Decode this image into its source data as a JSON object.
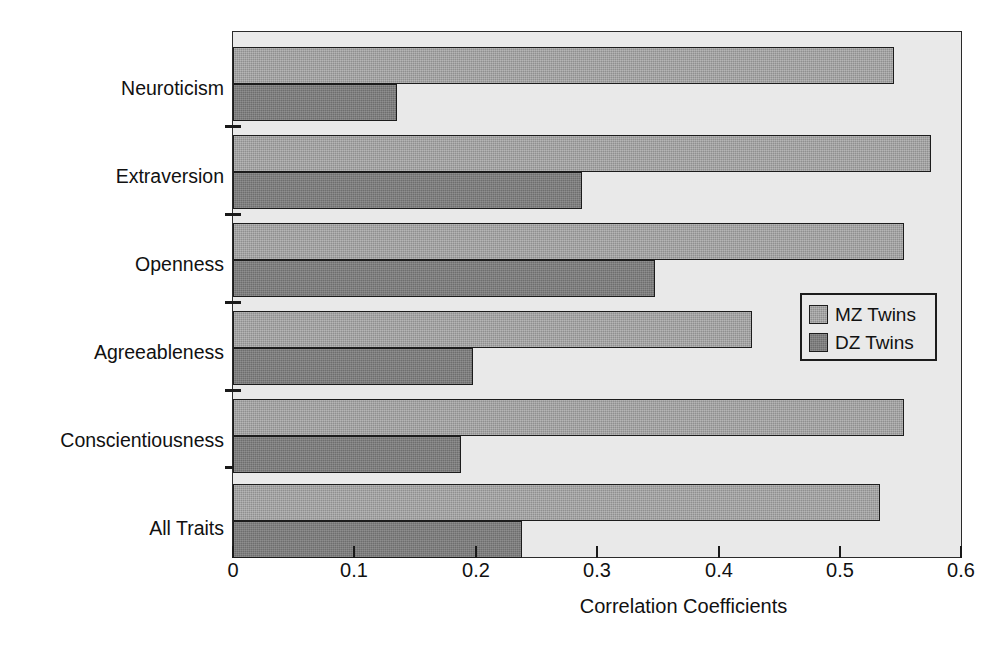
{
  "chart_data": {
    "type": "bar",
    "orientation": "horizontal",
    "title": "",
    "xlabel": "Correlation Coefficients",
    "ylabel": "",
    "xlim": [
      0,
      0.6
    ],
    "xticks": [
      "0",
      "0.1",
      "0.2",
      "0.3",
      "0.4",
      "0.5",
      "0.6"
    ],
    "xtick_values": [
      0,
      0.1,
      0.2,
      0.3,
      0.4,
      0.5,
      0.6
    ],
    "grid": false,
    "legend_position": "center-right",
    "categories": [
      "Neuroticism",
      "Extraversion",
      "Openness",
      "Agreeableness",
      "Conscientiousness",
      "All Traits"
    ],
    "series": [
      {
        "name": "MZ Twins",
        "color": "#8f8f8f",
        "values": [
          0.545,
          0.575,
          0.553,
          0.428,
          0.553,
          0.533
        ]
      },
      {
        "name": "DZ Twins",
        "color": "#6e6e6e",
        "values": [
          0.135,
          0.288,
          0.348,
          0.198,
          0.188,
          0.238
        ]
      }
    ]
  },
  "legend": {
    "items": [
      {
        "label": "MZ Twins",
        "swatch": "#8f8f8f"
      },
      {
        "label": "DZ Twins",
        "swatch": "#6e6e6e"
      }
    ]
  },
  "axis": {
    "x_title": "Correlation Coefficients"
  },
  "style": {
    "plot_background": "#e9e9e9",
    "page_background": "#ffffff",
    "axis_color": "#1c1c1c",
    "mz_color": "#8f8f8f",
    "dz_color": "#6e6e6e"
  }
}
